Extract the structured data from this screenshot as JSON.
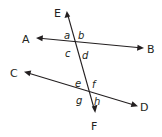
{
  "diagram": {
    "type": "parallel-lines-transversal",
    "colors": {
      "ink": "#231f20",
      "background": "#ffffff"
    },
    "lines": [
      {
        "name": "line-AB",
        "from": "A",
        "to": "B",
        "x1": 37,
        "y1": 38,
        "x2": 143,
        "y2": 48
      },
      {
        "name": "line-CD",
        "from": "C",
        "to": "D",
        "x1": 25,
        "y1": 72,
        "x2": 137,
        "y2": 106
      },
      {
        "name": "transversal-EF",
        "from": "E",
        "to": "F",
        "x1": 67,
        "y1": 12,
        "x2": 95,
        "y2": 112
      }
    ],
    "points": {
      "A": {
        "label": "A",
        "x": 22,
        "y": 43
      },
      "B": {
        "label": "B",
        "x": 147,
        "y": 53
      },
      "C": {
        "label": "C",
        "x": 10,
        "y": 77
      },
      "D": {
        "label": "D",
        "x": 140,
        "y": 111
      },
      "E": {
        "label": "E",
        "x": 54,
        "y": 17
      },
      "F": {
        "label": "F",
        "x": 91,
        "y": 130
      }
    },
    "angles": {
      "a": {
        "label": "a",
        "x": 64,
        "y": 39
      },
      "b": {
        "label": "b",
        "x": 78,
        "y": 39
      },
      "c": {
        "label": "c",
        "x": 65,
        "y": 57
      },
      "d": {
        "label": "d",
        "x": 82,
        "y": 59
      },
      "e": {
        "label": "e",
        "x": 75,
        "y": 87
      },
      "f": {
        "label": "f",
        "x": 92,
        "y": 88
      },
      "g": {
        "label": "g",
        "x": 76,
        "y": 104
      },
      "h": {
        "label": "h",
        "x": 94,
        "y": 105
      }
    }
  }
}
